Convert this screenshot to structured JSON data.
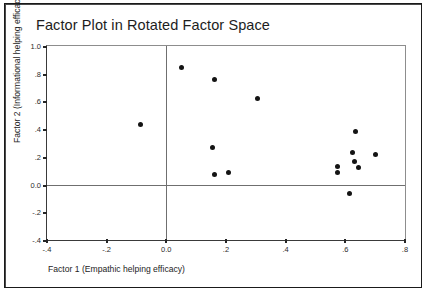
{
  "chart_data": {
    "type": "scatter",
    "title": "Factor Plot in Rotated Factor Space",
    "xlabel": "Factor 1 (Empathic helping efficacy)",
    "ylabel": "Factor 2 (Informational helping efficacy)",
    "xlim": [
      -0.4,
      0.8
    ],
    "ylim": [
      -0.4,
      1.0
    ],
    "xticks": [
      -0.4,
      -0.2,
      0.0,
      0.2,
      0.4,
      0.6,
      0.8
    ],
    "xtick_labels": [
      "-.4",
      "-.2",
      "0.0",
      ".2",
      ".4",
      ".6",
      ".8"
    ],
    "yticks": [
      1.0,
      0.8,
      0.6,
      0.4,
      0.2,
      0.0,
      -0.2,
      -0.4
    ],
    "ytick_labels": [
      "1.0",
      ".8",
      ".6",
      ".4",
      ".2",
      "0.0",
      "-.2",
      "-.4"
    ],
    "grid": false,
    "legend": null,
    "reference_lines": {
      "x": 0.0,
      "y": 0.0
    },
    "marker": {
      "shape": "circle",
      "color": "#141414",
      "size": 5
    },
    "points": [
      {
        "x": 0.05,
        "y": 0.845
      },
      {
        "x": 0.16,
        "y": 0.755
      },
      {
        "x": 0.305,
        "y": 0.62
      },
      {
        "x": -0.085,
        "y": 0.435
      },
      {
        "x": 0.155,
        "y": 0.27
      },
      {
        "x": 0.16,
        "y": 0.07
      },
      {
        "x": 0.21,
        "y": 0.09
      },
      {
        "x": 0.635,
        "y": 0.38
      },
      {
        "x": 0.625,
        "y": 0.235
      },
      {
        "x": 0.63,
        "y": 0.17
      },
      {
        "x": 0.645,
        "y": 0.125
      },
      {
        "x": 0.575,
        "y": 0.13
      },
      {
        "x": 0.575,
        "y": 0.085
      },
      {
        "x": 0.7,
        "y": 0.215
      },
      {
        "x": 0.615,
        "y": -0.065
      }
    ],
    "n_points": 15
  }
}
